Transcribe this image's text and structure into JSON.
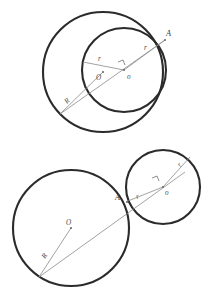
{
  "document": {
    "title": "Tangent Circles Construction",
    "background_color": "#ffffff",
    "stroke_color": "#2b2b2b",
    "construction_color": "#8a8a8a",
    "label_color": "#4a4a4a"
  },
  "figures": [
    {
      "id": "internal-tangency",
      "name": "Internally Tangent Circles",
      "circles": [
        {
          "role": "large",
          "center_label": "O",
          "radius_label": "R",
          "cx": 103,
          "cy": 72,
          "r": 60
        },
        {
          "role": "small",
          "center_label": "o",
          "radius_label": "r",
          "cx": 124,
          "cy": 70,
          "r": 42
        }
      ],
      "tangent_point_label": "A",
      "labels": {
        "big_center": "O",
        "small_center": "o",
        "big_radius": "R",
        "small_radius_right": "r",
        "small_radius_left": "r",
        "tangent_point": "A"
      }
    },
    {
      "id": "external-tangency",
      "name": "Externally Tangent Circles",
      "circles": [
        {
          "role": "large",
          "center_label": "O",
          "radius_label": "R",
          "cx": 71,
          "cy": 228,
          "r": 58
        },
        {
          "role": "small",
          "center_label": "o",
          "radius_label": "r",
          "cx": 163,
          "cy": 187,
          "r": 37
        }
      ],
      "tangent_point_label": "A",
      "labels": {
        "big_center": "O",
        "small_center": "o",
        "big_radius": "R",
        "small_radius_upper": "r",
        "small_radius_lower": "r",
        "tangent_point": "A"
      }
    }
  ]
}
